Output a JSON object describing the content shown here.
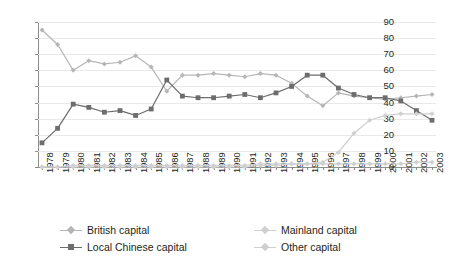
{
  "chart_data": {
    "type": "line",
    "title": "",
    "subtitle": "",
    "xlabel": "",
    "ylabel": "",
    "grid": true,
    "legend_position": "bottom",
    "ylim": [
      0,
      90
    ],
    "yticks": [
      0,
      10,
      20,
      30,
      40,
      50,
      60,
      70,
      80,
      90
    ],
    "categories": [
      "1978",
      "1979",
      "1980",
      "1981",
      "1982",
      "1983",
      "1984",
      "1985",
      "1986",
      "1987",
      "1988",
      "1989",
      "1990",
      "1991",
      "1992",
      "1993",
      "1994",
      "1995",
      "1996",
      "1997",
      "1998",
      "1999",
      "2000",
      "2001",
      "2002",
      "2003"
    ],
    "series": [
      {
        "name": "British capital",
        "color": "#b6b6b6",
        "marker": "diamond",
        "values": [
          85,
          76,
          60,
          66,
          64,
          65,
          69,
          62,
          47,
          57,
          57,
          58,
          57,
          56,
          58,
          57,
          52,
          44,
          38,
          46,
          44,
          43,
          42,
          43,
          44,
          45
        ]
      },
      {
        "name": "Local Chinese capital",
        "color": "#6d6d6d",
        "marker": "square",
        "values": [
          15,
          24,
          39,
          37,
          34,
          35,
          32,
          36,
          54,
          44,
          43,
          43,
          44,
          45,
          43,
          46,
          50,
          57,
          57,
          49,
          45,
          43,
          43,
          41,
          35,
          29
        ]
      },
      {
        "name": "Mainland capital",
        "color": "#d0d0d0",
        "marker": "diamond",
        "values": [
          0,
          0,
          0,
          0,
          0,
          0,
          0,
          0,
          0,
          0,
          0,
          0,
          0,
          0,
          1,
          1,
          2,
          2,
          3,
          9,
          21,
          29,
          32,
          33,
          33,
          33
        ]
      },
      {
        "name": "Other capital",
        "color": "#cfcfcf",
        "marker": "diamond",
        "values": [
          0,
          0,
          1,
          1,
          1,
          1,
          1,
          1,
          1,
          1,
          1,
          1,
          1,
          1,
          2,
          2,
          2,
          2,
          2,
          2,
          2,
          2,
          2,
          2,
          3,
          3
        ]
      }
    ]
  },
  "legend": {
    "items": [
      {
        "label": "British capital"
      },
      {
        "label": "Mainland capital"
      },
      {
        "label": "Local Chinese capital"
      },
      {
        "label": "Other capital"
      }
    ]
  }
}
